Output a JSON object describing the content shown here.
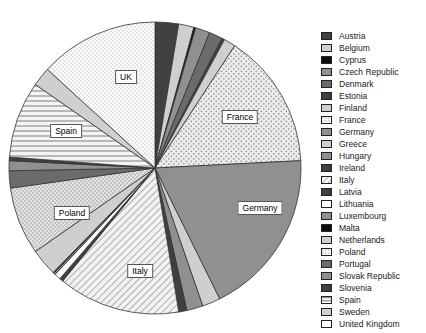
{
  "chart_data": {
    "type": "pie",
    "title": "",
    "legend_position": "right",
    "grid": false,
    "categories": [
      "Austria",
      "Belgium",
      "Cyprus",
      "Czech Republic",
      "Denmark",
      "Estonia",
      "Finland",
      "France",
      "Germany",
      "Greece",
      "Hungary",
      "Ireland",
      "Italy",
      "Latvia",
      "Lithuania",
      "Luxembourg",
      "Malta",
      "Netherlands",
      "Poland",
      "Portugal",
      "Slovak Republic",
      "Slovenia",
      "Spain",
      "Sweden",
      "United Kingdom"
    ],
    "values": [
      2.6,
      1.7,
      0.2,
      1.6,
      1.5,
      0.3,
      1.3,
      15.0,
      18.5,
      2.0,
      1.8,
      0.9,
      13.5,
      0.4,
      0.7,
      0.2,
      0.1,
      3.0,
      7.5,
      1.9,
      1.1,
      0.4,
      8.5,
      2.1,
      13.2
    ],
    "value_unit": "%",
    "start_angle_deg": 0,
    "direction": "clockwise",
    "slice_labels": [
      {
        "category": "France",
        "text": "France",
        "x": 240,
        "y": 117
      },
      {
        "category": "Germany",
        "text": "Germany",
        "x": 260,
        "y": 208
      },
      {
        "category": "Italy",
        "text": "Italy",
        "x": 140,
        "y": 271
      },
      {
        "category": "Poland",
        "text": "Poland",
        "x": 72,
        "y": 213
      },
      {
        "category": "Spain",
        "text": "Spain",
        "x": 66,
        "y": 131
      },
      {
        "category": "United Kingdom",
        "text": "UK",
        "x": 126,
        "y": 77
      }
    ],
    "pattern_by_category": {
      "Austria": "solid-dark",
      "Belgium": "solid-light",
      "Cyprus": "solid-black",
      "Czech Republic": "solid-medium",
      "Denmark": "solid-mediumdark",
      "Estonia": "solid-dark",
      "Finland": "solid-light",
      "France": "dots-coarse",
      "Germany": "solid-medium",
      "Greece": "solid-light",
      "Hungary": "solid-medium",
      "Ireland": "solid-dark",
      "Italy": "hatch-diagonal",
      "Latvia": "solid-dark",
      "Lithuania": "solid-white",
      "Luxembourg": "solid-medium",
      "Malta": "solid-black",
      "Netherlands": "solid-light",
      "Poland": "dots-cross",
      "Portugal": "solid-mediumdark",
      "Slovak Republic": "solid-medium",
      "Slovenia": "solid-dark",
      "Spain": "lines-horizontal",
      "Sweden": "solid-light",
      "United Kingdom": "dots-fine"
    },
    "colors": {
      "solid-black": "#0d0d0d",
      "solid-dark": "#404040",
      "solid-mediumdark": "#6b6b6b",
      "solid-medium": "#909090",
      "solid-light": "#cfcfcf",
      "solid-white": "#ffffff",
      "outline": "#333333",
      "background": "#ffffff",
      "text": "#1a1a1a"
    },
    "geometry": {
      "cx": 155,
      "cy": 168,
      "r": 146
    }
  },
  "legend": {
    "items": [
      {
        "label": "Austria"
      },
      {
        "label": "Belgium"
      },
      {
        "label": "Cyprus"
      },
      {
        "label": "Czech Republic"
      },
      {
        "label": "Denmark"
      },
      {
        "label": "Estonia"
      },
      {
        "label": "Finland"
      },
      {
        "label": "France"
      },
      {
        "label": "Germany"
      },
      {
        "label": "Greece"
      },
      {
        "label": "Hungary"
      },
      {
        "label": "Ireland"
      },
      {
        "label": "Italy"
      },
      {
        "label": "Latvia"
      },
      {
        "label": "Lithuania"
      },
      {
        "label": "Luxembourg"
      },
      {
        "label": "Malta"
      },
      {
        "label": "Netherlands"
      },
      {
        "label": "Poland"
      },
      {
        "label": "Portugal"
      },
      {
        "label": "Slovak Republic"
      },
      {
        "label": "Slovenia"
      },
      {
        "label": "Spain"
      },
      {
        "label": "Sweden"
      },
      {
        "label": "United Kingdom"
      }
    ]
  }
}
